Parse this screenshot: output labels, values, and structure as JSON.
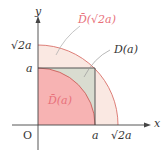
{
  "diagram": {
    "axes": {
      "x_label": "x",
      "y_label": "y",
      "origin_label": "O"
    },
    "ticks": {
      "x": [
        "a",
        "√2a"
      ],
      "y": [
        "a",
        "√2a"
      ]
    },
    "regions": [
      {
        "id": "outer-quarter-disc",
        "label": "D̄(√2a)",
        "radius": "√2a",
        "fill": "#fae8e2"
      },
      {
        "id": "square",
        "label": "D(a)",
        "side": "a",
        "fill": "#d9dcd0"
      },
      {
        "id": "inner-quarter-disc",
        "label": "D̄(a)",
        "radius": "a",
        "fill": "#f7b3b3"
      }
    ],
    "labels": {
      "outer": "D̄(√2a)",
      "square": "D(a)",
      "inner": "D̄(a)"
    },
    "colors": {
      "arc_stroke": "#d9706a",
      "square_stroke": "#555555",
      "pink_label": "#e8707a",
      "leader": "#aaaaaa"
    }
  }
}
